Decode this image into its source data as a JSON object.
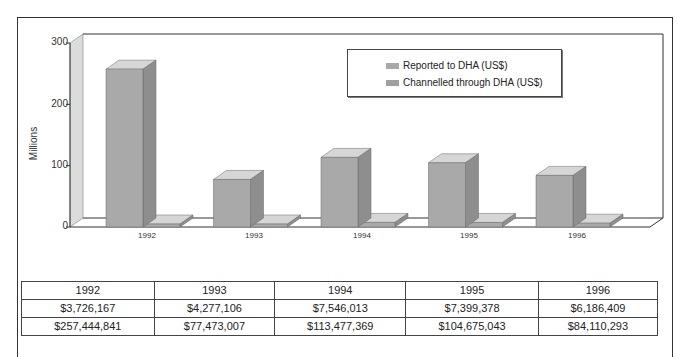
{
  "chart_data": {
    "type": "bar",
    "style": "3d-clustered",
    "title": "",
    "xlabel": "",
    "ylabel": "Millions",
    "ylim": [
      0,
      300
    ],
    "yticks": [
      0,
      100,
      200,
      300
    ],
    "categories": [
      "1992",
      "1993",
      "1994",
      "1995",
      "1996"
    ],
    "series": [
      {
        "name": "Reported to DHA (US$)",
        "values": [
          257.4,
          77.5,
          113.5,
          104.7,
          84.1
        ],
        "color": "#a9a9a9"
      },
      {
        "name": "Channelled through DHA (US$)",
        "values": [
          3.7,
          4.3,
          7.5,
          7.4,
          6.2
        ],
        "color": "#b3b3b3"
      }
    ],
    "legend_position": "top-right-inside",
    "grid": false
  },
  "axis": {
    "ylabel": "Millions",
    "yticks": [
      "0",
      "100",
      "200",
      "300"
    ],
    "xticks": [
      "1992",
      "1993",
      "1994",
      "1995",
      "1996"
    ]
  },
  "legend": {
    "items": [
      {
        "label": "Reported to DHA (US$)",
        "color": "#a9a9a9"
      },
      {
        "label": "Channelled through DHA (US$)",
        "color": "#a0a0a0"
      }
    ]
  },
  "table": {
    "header": [
      "1992",
      "1993",
      "1994",
      "1995",
      "1996"
    ],
    "rows": [
      [
        "$3,726,167",
        "$4,277,106",
        "$7,546,013",
        "$7,399,378",
        "$6,186,409"
      ],
      [
        "$257,444,841",
        "$77,473,007",
        "$113,477,369",
        "$104,675,043",
        "$84,110,293"
      ]
    ]
  },
  "colors": {
    "bar_front": "#a9a9a9",
    "bar_side": "#8e8e8e",
    "bar_top": "#d6d6d6",
    "wall": "#dcdcdc",
    "border": "#333333"
  }
}
